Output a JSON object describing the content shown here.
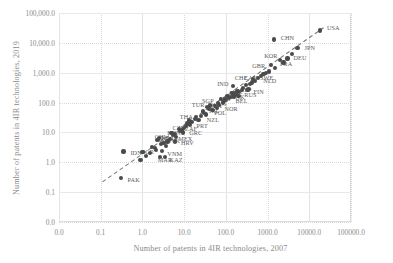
{
  "chart_data": {
    "type": "scatter",
    "title": "",
    "xlabel": "Number of patents in 4IR technologies, 2007",
    "ylabel": "Number of patents in 4IR technologies, 2019",
    "xticks": [
      "0.0",
      "0.1",
      "1.0",
      "10.0",
      "100.0",
      "1000.0",
      "10000.0",
      "100000.0"
    ],
    "yticks": [
      "100,000.0",
      "10,000.0",
      "1,000.0",
      "100.0",
      "10.0",
      "1.0",
      "0.1",
      "0.0"
    ],
    "xscale": "log",
    "yscale": "log",
    "xlim": [
      0.01,
      100000
    ],
    "ylim": [
      0.01,
      100000
    ],
    "grid": true,
    "legend": "none",
    "marker_color": "#4a4a4a",
    "grid_color": "#d9d9d9",
    "axis_text_color": "#8a8a8a",
    "trendline": {
      "style": "dashed",
      "color": "#7a7a7a",
      "x0": 0.11,
      "y0": 0.22,
      "x1": 22000,
      "y1": 32000
    },
    "points": [
      {
        "label": "USA",
        "x": 18000,
        "y": 26000,
        "lx": 7,
        "ly": -3
      },
      {
        "label": "CHN",
        "x": 1400,
        "y": 13000,
        "lx": 7,
        "ly": -2
      },
      {
        "label": "JPN",
        "x": 5200,
        "y": 6800,
        "lx": 7,
        "ly": -1
      },
      {
        "label": "DEU",
        "x": 3000,
        "y": 3000,
        "lx": 6,
        "ly": -1
      },
      {
        "label": "KOR",
        "x": 2000,
        "y": 2600,
        "lx": -16,
        "ly": -5
      },
      {
        "label": "FRA",
        "x": 1500,
        "y": 1400,
        "lx": 5,
        "ly": -5
      },
      {
        "label": "GBR",
        "x": 1100,
        "y": 1100,
        "lx": -17,
        "ly": -6
      },
      {
        "label": "CAN",
        "x": 700,
        "y": 800,
        "lx": -17,
        "ly": 2
      },
      {
        "label": "NLD",
        "x": 600,
        "y": 650,
        "lx": 5,
        "ly": 2
      },
      {
        "label": "SWE",
        "x": 500,
        "y": 520,
        "lx": 5,
        "ly": -4
      },
      {
        "label": "CHE",
        "x": 420,
        "y": 470,
        "lx": -17,
        "ly": -5
      },
      {
        "label": "FIN",
        "x": 330,
        "y": 260,
        "lx": 6,
        "ly": 1
      },
      {
        "label": "ITA",
        "x": 260,
        "y": 300,
        "lx": -14,
        "ly": 4
      },
      {
        "label": "IND",
        "x": 150,
        "y": 350,
        "lx": -16,
        "ly": -3
      },
      {
        "label": "ESP",
        "x": 170,
        "y": 200,
        "lx": 5,
        "ly": -4
      },
      {
        "label": "RUS",
        "x": 210,
        "y": 230,
        "lx": 5,
        "ly": 2
      },
      {
        "label": "AUT",
        "x": 150,
        "y": 180,
        "lx": -15,
        "ly": 3
      },
      {
        "label": "BEL",
        "x": 130,
        "y": 150,
        "lx": 5,
        "ly": 3
      },
      {
        "label": "AUS",
        "x": 120,
        "y": 140,
        "lx": -15,
        "ly": 5
      },
      {
        "label": "ISR",
        "x": 110,
        "y": 170,
        "lx": 5,
        "ly": -4
      },
      {
        "label": "BRA",
        "x": 90,
        "y": 110,
        "lx": -15,
        "ly": 4
      },
      {
        "label": "DNK",
        "x": 95,
        "y": 130,
        "lx": 6,
        "ly": -3
      },
      {
        "label": "NOR",
        "x": 70,
        "y": 85,
        "lx": 5,
        "ly": 4
      },
      {
        "label": "SGP",
        "x": 65,
        "y": 95,
        "lx": -16,
        "ly": -3
      },
      {
        "label": "POL",
        "x": 40,
        "y": 60,
        "lx": 5,
        "ly": 3
      },
      {
        "label": "TUR",
        "x": 35,
        "y": 70,
        "lx": -15,
        "ly": -3
      },
      {
        "label": "IRL",
        "x": 30,
        "y": 45,
        "lx": 5,
        "ly": -3
      },
      {
        "label": "NZL",
        "x": 25,
        "y": 35,
        "lx": 6,
        "ly": 3
      },
      {
        "label": "THA",
        "x": 18,
        "y": 28,
        "lx": -15,
        "ly": -3
      },
      {
        "label": "PRT",
        "x": 15,
        "y": 22,
        "lx": 5,
        "ly": 3
      },
      {
        "label": "CZE",
        "x": 12,
        "y": 20,
        "lx": -15,
        "ly": 4
      },
      {
        "label": "GRC",
        "x": 10,
        "y": 14,
        "lx": 5,
        "ly": 4
      },
      {
        "label": "HUN",
        "x": 9,
        "y": 12,
        "lx": -15,
        "ly": 2
      },
      {
        "label": "ZAF",
        "x": 8,
        "y": 11,
        "lx": 5,
        "ly": -3
      },
      {
        "label": "ROU",
        "x": 6,
        "y": 9,
        "lx": -15,
        "ly": 4
      },
      {
        "label": "MEX",
        "x": 5.5,
        "y": 8,
        "lx": 5,
        "ly": 3
      },
      {
        "label": "CHL",
        "x": 4.5,
        "y": 6,
        "lx": -15,
        "ly": -3
      },
      {
        "label": "HRV",
        "x": 6,
        "y": 5,
        "lx": 6,
        "ly": 1
      },
      {
        "label": "SVK",
        "x": 3.2,
        "y": 4.5,
        "lx": 4,
        "ly": -3
      },
      {
        "label": "MLT",
        "x": 2.3,
        "y": 5.5,
        "lx": 4,
        "ly": -3
      },
      {
        "label": "BGR",
        "x": 2.0,
        "y": 3.0,
        "lx": -14,
        "ly": 3
      },
      {
        "label": "VNM",
        "x": 3.0,
        "y": 2.4,
        "lx": 5,
        "ly": 2
      },
      {
        "label": "KAZ",
        "x": 3.4,
        "y": 1.5,
        "lx": 5,
        "ly": 2
      },
      {
        "label": "MAR",
        "x": 2.6,
        "y": 1.5,
        "lx": -2,
        "ly": 2
      },
      {
        "label": "IDN",
        "x": 0.35,
        "y": 2.3,
        "lx": 7,
        "ly": 1
      },
      {
        "label": "PAK",
        "x": 0.3,
        "y": 0.3,
        "lx": 7,
        "ly": 1
      },
      {
        "label": "",
        "x": 900,
        "y": 1000,
        "lx": 0,
        "ly": 0
      },
      {
        "label": "",
        "x": 1200,
        "y": 1800,
        "lx": 0,
        "ly": 0
      },
      {
        "label": "",
        "x": 800,
        "y": 900,
        "lx": 0,
        "ly": 0
      },
      {
        "label": "",
        "x": 450,
        "y": 600,
        "lx": 0,
        "ly": 0
      },
      {
        "label": "",
        "x": 380,
        "y": 420,
        "lx": 0,
        "ly": 0
      },
      {
        "label": "",
        "x": 300,
        "y": 380,
        "lx": 0,
        "ly": 0
      },
      {
        "label": "",
        "x": 240,
        "y": 260,
        "lx": 0,
        "ly": 0
      },
      {
        "label": "",
        "x": 190,
        "y": 240,
        "lx": 0,
        "ly": 0
      },
      {
        "label": "",
        "x": 160,
        "y": 160,
        "lx": 0,
        "ly": 0
      },
      {
        "label": "",
        "x": 140,
        "y": 210,
        "lx": 0,
        "ly": 0
      },
      {
        "label": "",
        "x": 100,
        "y": 120,
        "lx": 0,
        "ly": 0
      },
      {
        "label": "",
        "x": 85,
        "y": 100,
        "lx": 0,
        "ly": 0
      },
      {
        "label": "",
        "x": 75,
        "y": 130,
        "lx": 0,
        "ly": 0
      },
      {
        "label": "",
        "x": 55,
        "y": 75,
        "lx": 0,
        "ly": 0
      },
      {
        "label": "",
        "x": 48,
        "y": 55,
        "lx": 0,
        "ly": 0
      },
      {
        "label": "",
        "x": 42,
        "y": 80,
        "lx": 0,
        "ly": 0
      },
      {
        "label": "",
        "x": 33,
        "y": 40,
        "lx": 0,
        "ly": 0
      },
      {
        "label": "",
        "x": 28,
        "y": 50,
        "lx": 0,
        "ly": 0
      },
      {
        "label": "",
        "x": 22,
        "y": 26,
        "lx": 0,
        "ly": 0
      },
      {
        "label": "",
        "x": 19,
        "y": 33,
        "lx": 0,
        "ly": 0
      },
      {
        "label": "",
        "x": 14,
        "y": 18,
        "lx": 0,
        "ly": 0
      },
      {
        "label": "",
        "x": 11,
        "y": 16,
        "lx": 0,
        "ly": 0
      },
      {
        "label": "",
        "x": 9.5,
        "y": 10,
        "lx": 0,
        "ly": 0
      },
      {
        "label": "",
        "x": 7.5,
        "y": 13,
        "lx": 0,
        "ly": 0
      },
      {
        "label": "",
        "x": 6.5,
        "y": 7,
        "lx": 0,
        "ly": 0
      },
      {
        "label": "",
        "x": 5.0,
        "y": 9.5,
        "lx": 0,
        "ly": 0
      },
      {
        "label": "",
        "x": 4.0,
        "y": 5.0,
        "lx": 0,
        "ly": 0
      },
      {
        "label": "",
        "x": 3.6,
        "y": 3.6,
        "lx": 0,
        "ly": 0
      },
      {
        "label": "",
        "x": 2.8,
        "y": 4.0,
        "lx": 0,
        "ly": 0
      },
      {
        "label": "",
        "x": 2.1,
        "y": 2.6,
        "lx": 0,
        "ly": 0
      },
      {
        "label": "",
        "x": 1.7,
        "y": 3.2,
        "lx": 0,
        "ly": 0
      },
      {
        "label": "",
        "x": 1.5,
        "y": 2.0,
        "lx": 0,
        "ly": 0
      },
      {
        "label": "",
        "x": 1.2,
        "y": 1.6,
        "lx": 0,
        "ly": 0
      },
      {
        "label": "",
        "x": 1.0,
        "y": 2.2,
        "lx": 0,
        "ly": 0
      },
      {
        "label": "",
        "x": 0.9,
        "y": 1.2,
        "lx": 0,
        "ly": 0
      },
      {
        "label": "",
        "x": 2.5,
        "y": 6.5,
        "lx": 0,
        "ly": 0
      },
      {
        "label": "",
        "x": 13,
        "y": 25,
        "lx": 0,
        "ly": 0
      },
      {
        "label": "",
        "x": 60,
        "y": 65,
        "lx": 0,
        "ly": 0
      },
      {
        "label": "",
        "x": 200,
        "y": 170,
        "lx": 0,
        "ly": 0
      },
      {
        "label": "",
        "x": 350,
        "y": 290,
        "lx": 0,
        "ly": 0
      },
      {
        "label": "",
        "x": 2400,
        "y": 2200,
        "lx": 0,
        "ly": 0
      },
      {
        "label": "",
        "x": 3800,
        "y": 4200,
        "lx": 0,
        "ly": 0
      }
    ]
  }
}
